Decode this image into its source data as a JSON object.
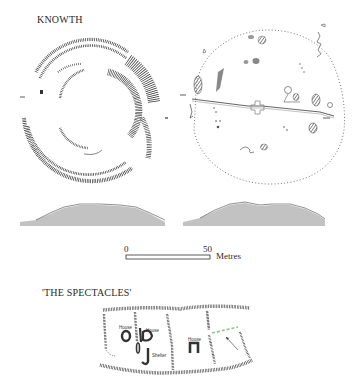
{
  "figure": {
    "knowth": {
      "title": "KNOWTH",
      "left_plan": {
        "label": "excavation-trench-plan",
        "center": [
          88,
          105
        ],
        "radius": 65
      },
      "right_plan": {
        "label": "mound-features-plan",
        "center": [
          266,
          106
        ],
        "rx": 80,
        "ry": 82
      },
      "profiles": [
        {
          "label": "profile-left",
          "x_start": 20,
          "x_end": 165,
          "baseline_y": 225,
          "peak_y": 205
        },
        {
          "label": "profile-right",
          "x_start": 183,
          "x_end": 325,
          "baseline_y": 224,
          "peak_y": 203
        }
      ]
    },
    "scale_bar": {
      "start_label": "0",
      "end_label": "50",
      "unit_label": "Metres"
    },
    "spectacles": {
      "title": "'THE SPECTACLES'",
      "labels": {
        "house_1": "House",
        "house_2": "House",
        "house_3": "House",
        "shelter": "Shelter"
      },
      "accent_color": "#8fbf8f"
    }
  }
}
